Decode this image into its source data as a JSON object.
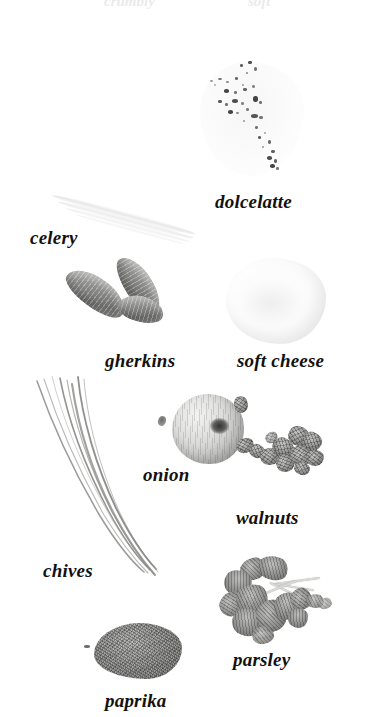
{
  "page": {
    "background_color": "#ffffff",
    "label_color": "#13110f",
    "style": "grayscale photographic ingredient plate with italic serif captions",
    "cut_off_top_text": [
      "crumbly",
      "soft"
    ]
  },
  "specimens": [
    {
      "id": "dolcelatte",
      "label": "dolcelatte",
      "kind": "blue-veined cheese wedge",
      "tone": "very pale with dark speckled veining"
    },
    {
      "id": "celery",
      "label": "celery",
      "kind": "pale celery stalk, diagonal",
      "tone": "near white, faint"
    },
    {
      "id": "gherkins",
      "label": "gherkins",
      "kind": "two curved pickled gherkins",
      "tone": "mid grey, ridged skin"
    },
    {
      "id": "soft-cheese",
      "label": "soft cheese",
      "kind": "rounded block of soft white cheese",
      "tone": "almost pure white"
    },
    {
      "id": "onion",
      "label": "onion",
      "kind": "whole round onion with root scar",
      "tone": "light grey with fine vertical striations"
    },
    {
      "id": "walnuts",
      "label": "walnuts",
      "kind": "cluster of shelled walnut halves and pieces",
      "tone": "dark textured grey"
    },
    {
      "id": "chives",
      "label": "chives",
      "kind": "bundle of long thin chive strands",
      "tone": "fine grey lines"
    },
    {
      "id": "parsley",
      "label": "parsley",
      "kind": "sprig of flat-leaf parsley",
      "tone": "dark grey leaves, light stems"
    },
    {
      "id": "paprika",
      "label": "paprika",
      "kind": "small heap of ground paprika powder",
      "tone": "granular mid-dark grey"
    }
  ],
  "labels": {
    "dolcelatte": "dolcelatte",
    "celery": "celery",
    "gherkins": "gherkins",
    "soft_cheese": "soft cheese",
    "onion": "onion",
    "walnuts": "walnuts",
    "chives": "chives",
    "parsley": "parsley",
    "paprika": "paprika"
  }
}
